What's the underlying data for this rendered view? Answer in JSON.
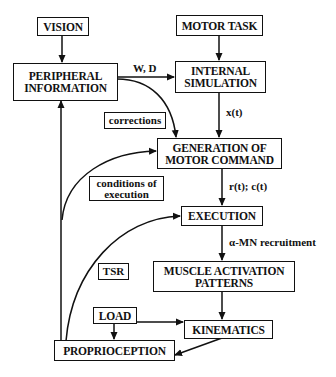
{
  "diagram": {
    "nodes": {
      "vision": "VISION",
      "motor_task": "MOTOR TASK",
      "peripheral_information": "PERIPHERAL\nINFORMATION",
      "internal_simulation": "INTERNAL\nSIMULATION",
      "generation_of_motor_command": "GENERATION OF\nMOTOR COMMAND",
      "execution": "EXECUTION",
      "muscle_activation_patterns": "MUSCLE ACTIVATION\nPATTERNS",
      "load": "LOAD",
      "kinematics": "KINEMATICS",
      "proprioception": "PROPRIOCEPTION"
    },
    "edge_tags": {
      "corrections": "corrections",
      "conditions_of_execution": "conditions of\nexecution",
      "tsr": "TSR"
    },
    "edge_labels": {
      "w_d": "W, D",
      "x_t": "x(t)",
      "r_t_c_t": "r(t); c(t)",
      "alpha_mn": "α-MN recruitment"
    },
    "edges": [
      {
        "from": "VISION",
        "to": "PERIPHERAL INFORMATION"
      },
      {
        "from": "MOTOR TASK",
        "to": "INTERNAL SIMULATION"
      },
      {
        "from": "PERIPHERAL INFORMATION",
        "to": "INTERNAL SIMULATION",
        "label": "W, D"
      },
      {
        "from": "PERIPHERAL INFORMATION",
        "to": "GENERATION OF MOTOR COMMAND",
        "label": "corrections"
      },
      {
        "from": "INTERNAL SIMULATION",
        "to": "GENERATION OF MOTOR COMMAND",
        "label": "x(t)"
      },
      {
        "from": "PROPRIOCEPTION",
        "to": "GENERATION OF MOTOR COMMAND",
        "label": "conditions of execution"
      },
      {
        "from": "GENERATION OF MOTOR COMMAND",
        "to": "EXECUTION",
        "label": "r(t); c(t)"
      },
      {
        "from": "PROPRIOCEPTION",
        "to": "EXECUTION",
        "label": "TSR"
      },
      {
        "from": "EXECUTION",
        "to": "MUSCLE ACTIVATION PATTERNS",
        "label": "α-MN recruitment"
      },
      {
        "from": "MUSCLE ACTIVATION PATTERNS",
        "to": "KINEMATICS"
      },
      {
        "from": "LOAD",
        "to": "KINEMATICS"
      },
      {
        "from": "LOAD",
        "to": "PROPRIOCEPTION"
      },
      {
        "from": "KINEMATICS",
        "to": "PROPRIOCEPTION"
      },
      {
        "from": "PROPRIOCEPTION",
        "to": "PERIPHERAL INFORMATION"
      }
    ]
  }
}
